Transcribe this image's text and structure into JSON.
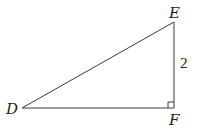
{
  "diagram": {
    "type": "right-triangle",
    "vertices": {
      "D": {
        "label": "D",
        "x": 22,
        "y": 108
      },
      "E": {
        "label": "E",
        "x": 174,
        "y": 22
      },
      "F": {
        "label": "F",
        "x": 174,
        "y": 108
      }
    },
    "right_angle_at": "F",
    "side_labels": {
      "EF": "2"
    },
    "colors": {
      "line": "#3a3a3a",
      "text": "#222222"
    }
  }
}
